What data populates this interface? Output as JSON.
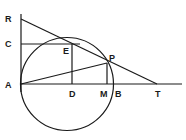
{
  "diagram": {
    "title": "",
    "type": "geometry",
    "stroke_color": "#1a1a1a",
    "background": "#ffffff",
    "points": {
      "R": {
        "label": "R",
        "x": 21,
        "y": 19
      },
      "C": {
        "label": "C",
        "x": 21,
        "y": 44
      },
      "A": {
        "label": "A",
        "x": 21,
        "y": 84
      },
      "E": {
        "label": "E",
        "x": 72,
        "y": 44
      },
      "D": {
        "label": "D",
        "x": 72,
        "y": 84
      },
      "P": {
        "label": "P",
        "x": 107,
        "y": 63
      },
      "M": {
        "label": "M",
        "x": 107,
        "y": 84
      },
      "B": {
        "label": "B",
        "x": 114,
        "y": 84
      },
      "T": {
        "label": "T",
        "x": 157,
        "y": 84
      }
    },
    "labels": [
      "R",
      "C",
      "E",
      "P",
      "A",
      "D",
      "M",
      "B",
      "T"
    ],
    "circle": {
      "cx": 67,
      "cy": 84,
      "r": 47,
      "through": [
        "A",
        "B"
      ]
    },
    "segments": [
      {
        "from": "R",
        "to": "A",
        "desc": "vertical line through R, C, A"
      },
      {
        "from": "A",
        "to": "T",
        "desc": "horizontal baseline through D, M, B, T"
      },
      {
        "from": "R",
        "to": "T",
        "desc": "tangent line through E and P"
      },
      {
        "from": "C",
        "to": "E",
        "desc": "horizontal segment"
      },
      {
        "from": "E",
        "to": "D",
        "desc": "vertical perpendicular"
      },
      {
        "from": "P",
        "to": "M",
        "desc": "vertical perpendicular"
      },
      {
        "from": "A",
        "to": "P",
        "desc": "chord"
      }
    ]
  }
}
